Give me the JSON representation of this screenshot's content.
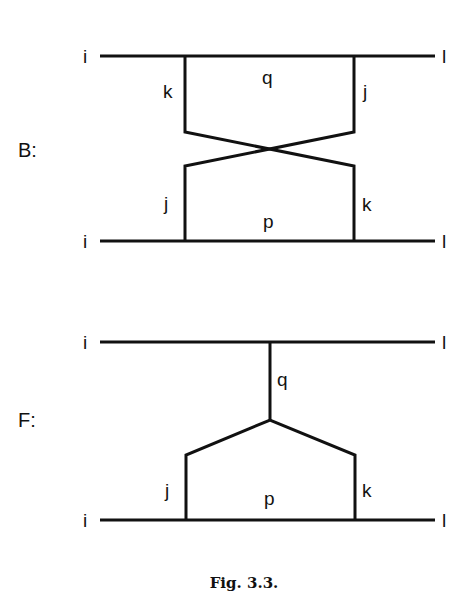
{
  "figure": {
    "caption": "Fig. 3.3.",
    "colors": {
      "line": "#111111",
      "background": "#ffffff"
    }
  },
  "diagram_B": {
    "panel_label": "B:",
    "top_left_label": "i",
    "top_right_label": "l",
    "bottom_left_label": "i",
    "bottom_right_label": "l",
    "top_left_leg_label": "k",
    "top_center_label": "q",
    "top_right_leg_label": "j",
    "bottom_left_leg_label": "j",
    "bottom_center_label": "p",
    "bottom_right_leg_label": "k"
  },
  "diagram_F": {
    "panel_label": "F:",
    "top_left_label": "i",
    "top_right_label": "l",
    "bottom_left_label": "i",
    "bottom_right_label": "l",
    "stem_label": "q",
    "left_leg_label": "j",
    "bottom_center_label": "p",
    "right_leg_label": "k"
  }
}
